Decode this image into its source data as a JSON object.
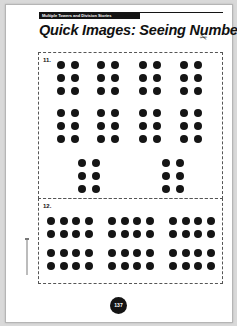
{
  "header": {
    "series_label": "Multiple Towers and Division Stories",
    "title": "Quick Images: Seeing Numbers",
    "subtitle": "(page 4 of 6)"
  },
  "icons": {
    "scissors": "✂"
  },
  "problems": [
    {
      "label": "11.",
      "description": "Ten groups of 6 dots (2 columns × 3 rows) arranged in 4 columns × 2 rows, plus 2 groups below",
      "groups": [
        {
          "cols": 2,
          "rows": 3
        },
        {
          "cols": 2,
          "rows": 3
        },
        {
          "cols": 2,
          "rows": 3
        },
        {
          "cols": 2,
          "rows": 3
        },
        {
          "cols": 2,
          "rows": 3
        },
        {
          "cols": 2,
          "rows": 3
        },
        {
          "cols": 2,
          "rows": 3
        },
        {
          "cols": 2,
          "rows": 3
        },
        {
          "cols": 2,
          "rows": 3
        },
        {
          "cols": 2,
          "rows": 3
        }
      ]
    },
    {
      "label": "12.",
      "description": "Six groups of 8 dots (4 columns × 2 rows) arranged in 3 columns × 2 rows",
      "groups": [
        {
          "cols": 4,
          "rows": 2
        },
        {
          "cols": 4,
          "rows": 2
        },
        {
          "cols": 4,
          "rows": 2
        },
        {
          "cols": 4,
          "rows": 2
        },
        {
          "cols": 4,
          "rows": 2
        },
        {
          "cols": 4,
          "rows": 2
        }
      ]
    }
  ],
  "footer": {
    "page_number": "137"
  },
  "colors": {
    "ink": "#151515",
    "page": "#ffffff",
    "background": "#d9d9d9"
  }
}
